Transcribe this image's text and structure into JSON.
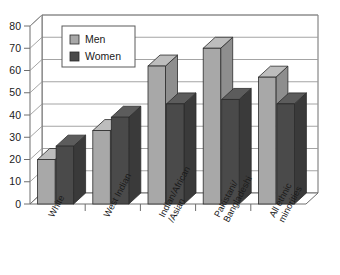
{
  "chart_data": {
    "type": "bar",
    "title": "",
    "subtitle": "",
    "xlabel": "",
    "ylabel": "",
    "ylim": [
      0,
      80
    ],
    "ytick_labels": [
      "0",
      "10",
      "20",
      "30",
      "40",
      "50",
      "60",
      "70",
      "80"
    ],
    "ytick_values": [
      0,
      10,
      20,
      30,
      40,
      50,
      60,
      70,
      80
    ],
    "grid": true,
    "grid_orientation": "horizontal",
    "three_d": true,
    "legend_position": "upper-left-inside",
    "categories": [
      "White",
      "West Indian",
      "Indian/African /Asian",
      "Pakistani/ Bangladeshi",
      "All ethnic minorities"
    ],
    "category_lines": [
      [
        "White"
      ],
      [
        "West Indian"
      ],
      [
        "Indian/African",
        "/Asian"
      ],
      [
        "Pakistani/",
        "Bangladeshi"
      ],
      [
        "All ethnic",
        "minorities"
      ]
    ],
    "series": [
      {
        "name": "Men",
        "color": "#a8a8a8",
        "side_color": "#8e8e8e",
        "top_color": "#bdbdbd",
        "values": [
          20,
          33,
          62,
          70,
          57
        ]
      },
      {
        "name": "Women",
        "color": "#4a4a4a",
        "side_color": "#3a3a3a",
        "top_color": "#5c5c5c",
        "values": [
          26,
          39,
          45,
          47,
          45
        ]
      }
    ]
  },
  "legend": {
    "entries": [
      {
        "label": "Men",
        "swatch": "#a8a8a8"
      },
      {
        "label": "Women",
        "swatch": "#4a4a4a"
      }
    ]
  },
  "style": {
    "axis_color": "#6e6e6e",
    "grid_color": "#9a9a9a",
    "text_color": "#1a1a1a",
    "background": "#ffffff",
    "men_color": "#a8a8a8",
    "women_color": "#4a4a4a"
  }
}
